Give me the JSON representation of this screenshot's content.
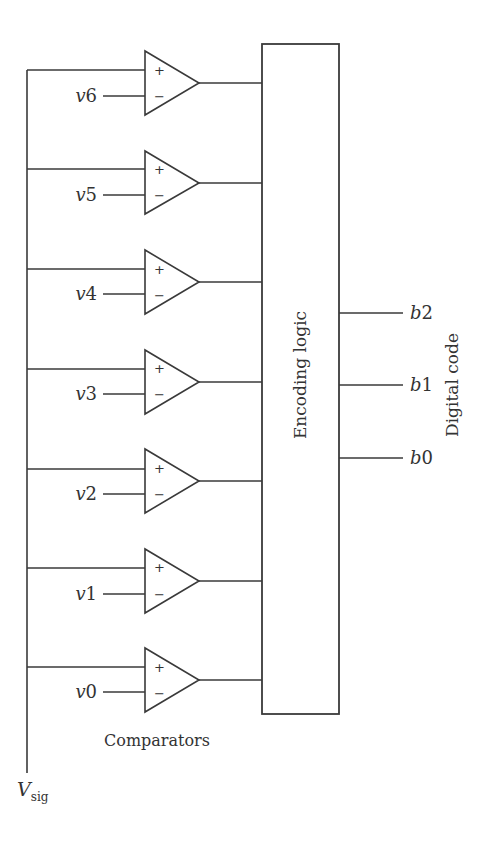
{
  "diagram": {
    "input": {
      "label": "V",
      "subscript": "sig"
    },
    "comparators_label": "Comparators",
    "encoder_label": "Encoding logic",
    "output_group_label": "Digital code",
    "plus_sign": "+",
    "minus_sign": "−",
    "comparators": [
      {
        "ref": "v6",
        "ref_prefix": "v",
        "ref_index": "6"
      },
      {
        "ref": "v5",
        "ref_prefix": "v",
        "ref_index": "5"
      },
      {
        "ref": "v4",
        "ref_prefix": "v",
        "ref_index": "4"
      },
      {
        "ref": "v3",
        "ref_prefix": "v",
        "ref_index": "3"
      },
      {
        "ref": "v2",
        "ref_prefix": "v",
        "ref_index": "2"
      },
      {
        "ref": "v1",
        "ref_prefix": "v",
        "ref_index": "1"
      },
      {
        "ref": "v0",
        "ref_prefix": "v",
        "ref_index": "0"
      }
    ],
    "outputs": [
      {
        "bit": "b2",
        "prefix": "b",
        "index": "2"
      },
      {
        "bit": "b1",
        "prefix": "b",
        "index": "1"
      },
      {
        "bit": "b0",
        "prefix": "b",
        "index": "0"
      }
    ],
    "colors": {
      "line": "#3a3a3a",
      "text": "#333333",
      "background": "#ffffff"
    }
  }
}
